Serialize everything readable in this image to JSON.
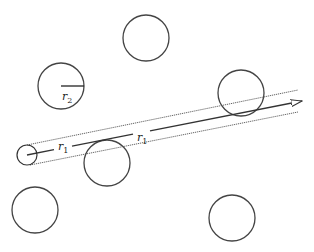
{
  "diagram": {
    "type": "collision-cylinder",
    "stroke_color": "#444444",
    "line_color": "#333333",
    "moving_particle": {
      "cx": 27,
      "cy": 155,
      "r": 10
    },
    "path": {
      "center_line": {
        "x1": 27,
        "y1": 155,
        "x2": 302,
        "y2": 101
      },
      "upper_edge": {
        "x1": 27,
        "y1": 145,
        "x2": 298,
        "y2": 90
      },
      "lower_edge": {
        "x1": 30,
        "y1": 165,
        "x2": 298,
        "y2": 112
      },
      "arrow_tip": {
        "x": 303,
        "y": 101
      }
    },
    "target_particles": [
      {
        "cx": 146,
        "cy": 38,
        "r": 23
      },
      {
        "cx": 61,
        "cy": 86,
        "r": 23
      },
      {
        "cx": 241,
        "cy": 93,
        "r": 23
      },
      {
        "cx": 107,
        "cy": 163,
        "r": 23
      },
      {
        "cx": 35,
        "cy": 210,
        "r": 23
      },
      {
        "cx": 232,
        "cy": 218,
        "r": 23
      }
    ],
    "labels": {
      "r1_left": {
        "base": "r",
        "sub": "1",
        "x": 58,
        "y": 150
      },
      "r1_right": {
        "base": "r",
        "sub": "1",
        "x": 137,
        "y": 141
      },
      "r2": {
        "base": "r",
        "sub": "2",
        "x": 62,
        "y": 100
      }
    }
  }
}
